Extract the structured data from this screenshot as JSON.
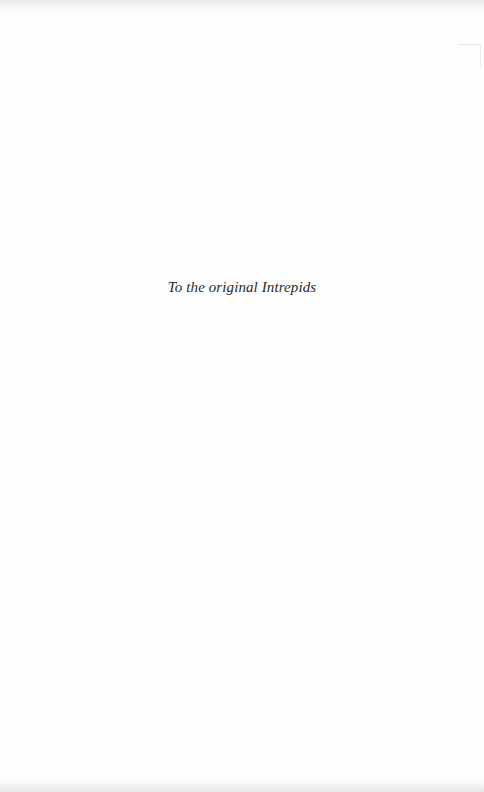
{
  "page": {
    "type": "dedication",
    "dedication_text": "To the original Intrepids"
  },
  "colors": {
    "background": "#fefefe",
    "text": "#2a2a2a"
  }
}
